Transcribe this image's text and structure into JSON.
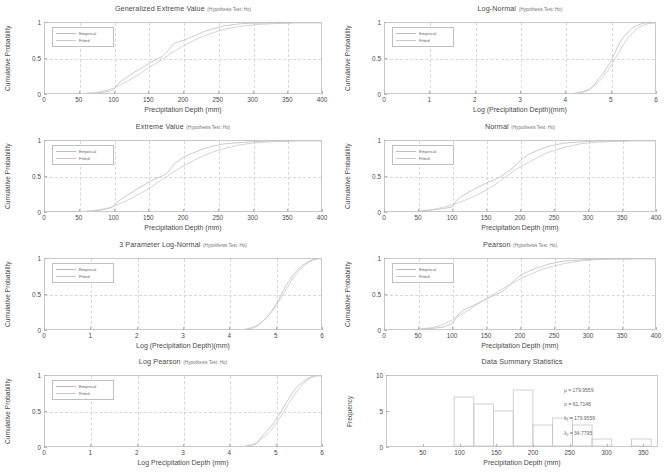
{
  "figure": {
    "hypothesis_suffix": "(Hypothesis Test: Ho)",
    "legend": {
      "empirical": "Empirical",
      "fitted": "Fitted"
    },
    "colors": {
      "axis": "#c9c9c9",
      "grid": "#d8d8d8",
      "empirical": "#bdbdbd",
      "fitted": "#c8c8c8",
      "text": "#4a4a4a"
    }
  },
  "chart_data": [
    {
      "type": "line",
      "id": "generalized-extreme-value",
      "title": "Generalized Extreme Value",
      "hypothesis": "(Hypothesis Test: Ho)",
      "xlabel": "Precipitation Depth (mm)",
      "ylabel": "Cumulative Probability",
      "xlim": [
        0,
        400
      ],
      "ylim": [
        0,
        1
      ],
      "xticks": [
        0,
        50,
        100,
        150,
        200,
        250,
        300,
        350,
        400
      ],
      "yticks": [
        0,
        0.5,
        1
      ],
      "grid": true,
      "legend": [
        "Empirical",
        "Fitted"
      ],
      "legend_position": "upper-left",
      "series": [
        {
          "name": "Empirical",
          "x": [
            75,
            85,
            95,
            100,
            103,
            107,
            112,
            118,
            124,
            130,
            137,
            144,
            150,
            157,
            163,
            170,
            176,
            180,
            183,
            186,
            190,
            196,
            203,
            210,
            217,
            224,
            231,
            238,
            245,
            252,
            260,
            268,
            276,
            285,
            295,
            310,
            330,
            358
          ],
          "y": [
            0.0,
            0.01,
            0.03,
            0.05,
            0.1,
            0.14,
            0.18,
            0.22,
            0.26,
            0.3,
            0.34,
            0.38,
            0.42,
            0.46,
            0.49,
            0.52,
            0.58,
            0.62,
            0.66,
            0.7,
            0.72,
            0.74,
            0.76,
            0.79,
            0.82,
            0.85,
            0.88,
            0.9,
            0.92,
            0.94,
            0.96,
            0.97,
            0.98,
            0.99,
            0.995,
            0.998,
            1.0,
            1.0
          ]
        },
        {
          "name": "Fitted",
          "x": [
            60,
            75,
            90,
            100,
            110,
            120,
            130,
            140,
            150,
            160,
            170,
            180,
            190,
            200,
            210,
            220,
            230,
            240,
            250,
            260,
            275,
            290,
            310,
            330,
            360,
            400
          ],
          "y": [
            0.0,
            0.01,
            0.04,
            0.07,
            0.12,
            0.17,
            0.23,
            0.29,
            0.36,
            0.42,
            0.48,
            0.55,
            0.61,
            0.67,
            0.72,
            0.77,
            0.81,
            0.85,
            0.88,
            0.91,
            0.94,
            0.96,
            0.98,
            0.99,
            1.0,
            1.0
          ]
        }
      ]
    },
    {
      "type": "line",
      "id": "log-normal",
      "title": "Log-Normal",
      "hypothesis": "(Hypothesis Test: Ho)",
      "xlabel": "Log (Precipitation Depth)(mm)",
      "ylabel": "Cumulative Probability",
      "xlim": [
        0,
        6
      ],
      "ylim": [
        0,
        1
      ],
      "xticks": [
        0,
        1,
        2,
        3,
        4,
        5,
        6
      ],
      "yticks": [
        0,
        0.5,
        1
      ],
      "grid": true,
      "legend": [
        "Empirical",
        "Fitted"
      ],
      "legend_position": "upper-left",
      "series": [
        {
          "name": "Empirical",
          "x": [
            4.3,
            4.45,
            4.55,
            4.62,
            4.68,
            4.74,
            4.8,
            4.85,
            4.9,
            4.95,
            5.0,
            5.05,
            5.1,
            5.15,
            5.2,
            5.25,
            5.3,
            5.35,
            5.4,
            5.45,
            5.5,
            5.55,
            5.62,
            5.7,
            5.78,
            5.88
          ],
          "y": [
            0.0,
            0.02,
            0.05,
            0.1,
            0.14,
            0.2,
            0.24,
            0.28,
            0.33,
            0.38,
            0.43,
            0.5,
            0.56,
            0.63,
            0.7,
            0.75,
            0.8,
            0.84,
            0.86,
            0.9,
            0.93,
            0.95,
            0.97,
            0.99,
            1.0,
            1.0
          ]
        },
        {
          "name": "Fitted",
          "x": [
            4.2,
            4.4,
            4.55,
            4.65,
            4.75,
            4.85,
            4.95,
            5.05,
            5.15,
            5.25,
            5.35,
            5.45,
            5.55,
            5.65,
            5.75,
            5.85,
            6.0
          ],
          "y": [
            0.0,
            0.02,
            0.06,
            0.1,
            0.16,
            0.23,
            0.32,
            0.42,
            0.53,
            0.64,
            0.74,
            0.82,
            0.89,
            0.94,
            0.97,
            0.99,
            1.0
          ]
        }
      ]
    },
    {
      "type": "line",
      "id": "extreme-value",
      "title": "Extreme Value",
      "hypothesis": "(Hypothesis Test: Ho)",
      "xlabel": "Precipitation Depth (mm)",
      "ylabel": "Cumulative Probability",
      "xlim": [
        0,
        400
      ],
      "ylim": [
        0,
        1
      ],
      "xticks": [
        0,
        50,
        100,
        150,
        200,
        250,
        300,
        350,
        400
      ],
      "yticks": [
        0,
        0.5,
        1
      ],
      "grid": true,
      "legend": [
        "Empirical",
        "Fitted"
      ],
      "legend_position": "upper-left",
      "series": [
        {
          "name": "Empirical",
          "x": [
            70,
            85,
            97,
            100,
            105,
            112,
            120,
            128,
            136,
            145,
            153,
            162,
            170,
            178,
            183,
            188,
            195,
            203,
            212,
            220,
            230,
            240,
            250,
            260,
            272,
            285,
            300,
            320,
            345,
            362
          ],
          "y": [
            0.0,
            0.02,
            0.05,
            0.08,
            0.13,
            0.18,
            0.23,
            0.28,
            0.33,
            0.38,
            0.43,
            0.47,
            0.5,
            0.55,
            0.62,
            0.68,
            0.73,
            0.78,
            0.82,
            0.85,
            0.89,
            0.92,
            0.94,
            0.96,
            0.97,
            0.98,
            0.99,
            1.0,
            1.0,
            1.0
          ]
        },
        {
          "name": "Fitted",
          "x": [
            60,
            80,
            95,
            110,
            125,
            140,
            155,
            170,
            185,
            200,
            215,
            230,
            245,
            260,
            280,
            300,
            330,
            360,
            400
          ],
          "y": [
            0.0,
            0.02,
            0.05,
            0.11,
            0.18,
            0.26,
            0.35,
            0.45,
            0.55,
            0.64,
            0.72,
            0.79,
            0.85,
            0.89,
            0.94,
            0.97,
            0.99,
            1.0,
            1.0
          ]
        }
      ]
    },
    {
      "type": "line",
      "id": "normal",
      "title": "Normal",
      "hypothesis": "(Hypothesis Test: Ho)",
      "xlabel": "Precipitation Depth (mm)",
      "ylabel": "Cumulative Probability",
      "xlim": [
        0,
        400
      ],
      "ylim": [
        0,
        1
      ],
      "xticks": [
        0,
        50,
        100,
        150,
        200,
        250,
        300,
        350,
        400
      ],
      "yticks": [
        0,
        0.5,
        1
      ],
      "grid": true,
      "legend": [
        "Empirical",
        "Fitted"
      ],
      "legend_position": "upper-left",
      "series": [
        {
          "name": "Empirical",
          "x": [
            55,
            75,
            90,
            100,
            105,
            112,
            120,
            130,
            140,
            150,
            160,
            170,
            180,
            190,
            198,
            205,
            215,
            225,
            235,
            245,
            255,
            265,
            280,
            295,
            315,
            340,
            362
          ],
          "y": [
            0.0,
            0.02,
            0.04,
            0.06,
            0.14,
            0.2,
            0.25,
            0.3,
            0.35,
            0.4,
            0.44,
            0.48,
            0.55,
            0.62,
            0.7,
            0.76,
            0.82,
            0.86,
            0.9,
            0.93,
            0.95,
            0.97,
            0.98,
            0.99,
            1.0,
            1.0,
            1.0
          ]
        },
        {
          "name": "Fitted",
          "x": [
            50,
            70,
            90,
            110,
            130,
            150,
            170,
            180,
            195,
            210,
            225,
            240,
            255,
            270,
            290,
            310,
            330,
            360,
            400
          ],
          "y": [
            0.0,
            0.02,
            0.06,
            0.12,
            0.2,
            0.3,
            0.42,
            0.5,
            0.6,
            0.68,
            0.76,
            0.83,
            0.88,
            0.92,
            0.96,
            0.98,
            0.99,
            1.0,
            1.0
          ]
        }
      ]
    },
    {
      "type": "line",
      "id": "3-parameter-log-normal",
      "title": "3 Parameter Log-Normal",
      "hypothesis": "(Hypothesis Test: Ho)",
      "xlabel": "Log (Precipitation Depth)(mm)",
      "ylabel": "Cumulative Probability",
      "xlim": [
        0,
        6
      ],
      "ylim": [
        0,
        1
      ],
      "xticks": [
        0,
        1,
        2,
        3,
        4,
        5,
        6
      ],
      "yticks": [
        0,
        0.5,
        1
      ],
      "grid": true,
      "legend": [
        "Empirical",
        "Fitted"
      ],
      "legend_position": "upper-left",
      "series": [
        {
          "name": "Empirical",
          "x": [
            4.4,
            4.55,
            4.63,
            4.7,
            4.76,
            4.82,
            4.88,
            4.93,
            4.98,
            5.03,
            5.08,
            5.13,
            5.18,
            5.24,
            5.3,
            5.36,
            5.42,
            5.48,
            5.55,
            5.62,
            5.7,
            5.78,
            5.85,
            5.92
          ],
          "y": [
            0.0,
            0.02,
            0.05,
            0.09,
            0.13,
            0.17,
            0.21,
            0.26,
            0.31,
            0.36,
            0.42,
            0.48,
            0.55,
            0.62,
            0.68,
            0.74,
            0.79,
            0.84,
            0.88,
            0.92,
            0.95,
            0.98,
            1.0,
            1.0
          ]
        },
        {
          "name": "Fitted",
          "x": [
            4.35,
            4.5,
            4.62,
            4.72,
            4.82,
            4.92,
            5.02,
            5.12,
            5.22,
            5.32,
            5.42,
            5.52,
            5.62,
            5.72,
            5.82,
            5.92,
            6.0
          ],
          "y": [
            0.0,
            0.02,
            0.05,
            0.1,
            0.16,
            0.24,
            0.33,
            0.43,
            0.54,
            0.65,
            0.75,
            0.83,
            0.9,
            0.95,
            0.98,
            1.0,
            1.0
          ]
        }
      ]
    },
    {
      "type": "line",
      "id": "pearson",
      "title": "Pearson",
      "hypothesis": "(Hypothesis Test: Ho)",
      "xlabel": "Precipitation Depth (mm)",
      "ylabel": "Cumulative Probability",
      "xlim": [
        0,
        400
      ],
      "ylim": [
        0,
        1
      ],
      "xticks": [
        0,
        50,
        100,
        150,
        200,
        250,
        300,
        350,
        400
      ],
      "yticks": [
        0,
        0.5,
        1
      ],
      "grid": true,
      "legend": [
        "Empirical",
        "Fitted"
      ],
      "legend_position": "upper-left",
      "series": [
        {
          "name": "Empirical",
          "x": [
            55,
            72,
            88,
            100,
            108,
            115,
            122,
            130,
            138,
            146,
            155,
            164,
            173,
            182,
            190,
            197,
            205,
            214,
            224,
            234,
            244,
            254,
            265,
            278,
            295,
            318,
            345,
            365
          ],
          "y": [
            0.0,
            0.01,
            0.03,
            0.08,
            0.2,
            0.26,
            0.3,
            0.33,
            0.37,
            0.41,
            0.45,
            0.49,
            0.53,
            0.6,
            0.68,
            0.74,
            0.79,
            0.83,
            0.87,
            0.9,
            0.93,
            0.95,
            0.97,
            0.98,
            0.99,
            1.0,
            1.0,
            1.0
          ]
        },
        {
          "name": "Fitted",
          "x": [
            50,
            70,
            85,
            100,
            115,
            130,
            145,
            160,
            175,
            190,
            205,
            220,
            235,
            250,
            268,
            288,
            310,
            340,
            400
          ],
          "y": [
            0.0,
            0.02,
            0.06,
            0.13,
            0.22,
            0.31,
            0.4,
            0.49,
            0.58,
            0.66,
            0.74,
            0.8,
            0.86,
            0.9,
            0.94,
            0.97,
            0.99,
            1.0,
            1.0
          ]
        }
      ]
    },
    {
      "type": "line",
      "id": "log-pearson",
      "title": "Log Pearson",
      "hypothesis": "(Hypothesis Test: Ho)",
      "xlabel": "Log Precipitation Depth (mm)",
      "ylabel": "Cumulative Probability",
      "xlim": [
        0,
        6
      ],
      "ylim": [
        0,
        1
      ],
      "xticks": [
        0,
        1,
        2,
        3,
        4,
        5,
        6
      ],
      "yticks": [
        0,
        0.5,
        1
      ],
      "grid": true,
      "legend": [
        "Empirical",
        "Fitted"
      ],
      "legend_position": "upper-left",
      "series": [
        {
          "name": "Empirical",
          "x": [
            4.4,
            4.55,
            4.63,
            4.68,
            4.72,
            4.78,
            4.84,
            4.9,
            4.96,
            5.02,
            5.08,
            5.14,
            5.2,
            5.26,
            5.32,
            5.38,
            5.45,
            5.52,
            5.6,
            5.68,
            5.76,
            5.84,
            5.9
          ],
          "y": [
            0.0,
            0.02,
            0.05,
            0.1,
            0.14,
            0.18,
            0.22,
            0.27,
            0.32,
            0.38,
            0.44,
            0.5,
            0.57,
            0.63,
            0.7,
            0.76,
            0.82,
            0.87,
            0.91,
            0.95,
            0.98,
            1.0,
            1.0
          ]
        },
        {
          "name": "Fitted",
          "x": [
            4.35,
            4.5,
            4.6,
            4.7,
            4.8,
            4.9,
            5.0,
            5.1,
            5.2,
            5.3,
            5.4,
            5.5,
            5.6,
            5.7,
            5.8,
            5.9,
            6.0
          ],
          "y": [
            0.0,
            0.02,
            0.05,
            0.1,
            0.15,
            0.21,
            0.3,
            0.4,
            0.5,
            0.61,
            0.71,
            0.8,
            0.88,
            0.94,
            0.98,
            1.0,
            1.0
          ]
        }
      ]
    },
    {
      "type": "bar",
      "id": "data-summary-statistics",
      "title": "Data Summary Statistics",
      "xlabel": "Precipitation Depth (mm)",
      "ylabel": "Frequency",
      "xlim": [
        0,
        370
      ],
      "ylim": [
        0,
        10
      ],
      "xticks": [
        50,
        100,
        150,
        200,
        250,
        300,
        350
      ],
      "yticks": [
        0,
        5,
        10
      ],
      "grid": false,
      "bin_edges": [
        92,
        119,
        146,
        173,
        200,
        227,
        254,
        281,
        308,
        335,
        362
      ],
      "bin_centers": [
        105,
        132,
        159,
        186,
        213,
        240,
        267,
        294,
        321,
        348
      ],
      "values": [
        7,
        6,
        5,
        8,
        3,
        4,
        3,
        1,
        0,
        1
      ],
      "annotations": [
        {
          "label": "μ = 179.9559",
          "symbol": "mu",
          "value": "179.9559"
        },
        {
          "label": "σ = 61.7148",
          "symbol": "sigma",
          "value": "61.7148"
        },
        {
          "label": "λ",
          "sub": "1",
          "rest": " = 179.9559",
          "symbol": "lambda-1",
          "value": "179.9559"
        },
        {
          "label": "λ",
          "sub": "2",
          "rest": " = 34.7795",
          "symbol": "lambda-2",
          "value": "34.7795"
        }
      ]
    }
  ]
}
